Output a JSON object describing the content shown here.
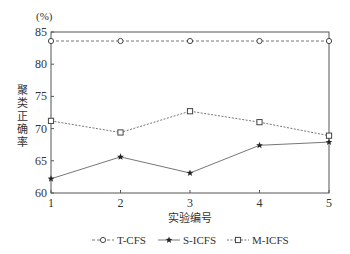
{
  "chart_data": {
    "type": "line",
    "title": "",
    "xlabel": "实验编号",
    "ylabel": "聚类正确率",
    "y_unit": "(%)",
    "x": [
      1,
      2,
      3,
      4,
      5
    ],
    "x_tick_labels": [
      "1",
      "2",
      "3",
      "4",
      "5"
    ],
    "ylim": [
      60,
      85
    ],
    "y_ticks": [
      60,
      65,
      70,
      75,
      80,
      85
    ],
    "y_tick_labels": [
      "60",
      "65",
      "70",
      "75",
      "80",
      "85"
    ],
    "grid": false,
    "legend_position": "bottom",
    "series": [
      {
        "name": "T-CFS",
        "marker": "open-circle",
        "line": "dashed",
        "values": [
          83.6,
          83.6,
          83.6,
          83.6,
          83.6
        ]
      },
      {
        "name": "S-ICFS",
        "marker": "star",
        "line": "solid",
        "values": [
          62.2,
          65.6,
          63.1,
          67.4,
          67.9
        ]
      },
      {
        "name": "M-ICFS",
        "marker": "open-square",
        "line": "dotted",
        "values": [
          71.2,
          69.4,
          72.7,
          71.0,
          68.9
        ]
      }
    ]
  },
  "legend": {
    "items": [
      "T-CFS",
      "S-ICFS",
      "M-ICFS"
    ]
  },
  "colors": {
    "axis": "#555555",
    "line": "#666666",
    "text": "#333333"
  }
}
